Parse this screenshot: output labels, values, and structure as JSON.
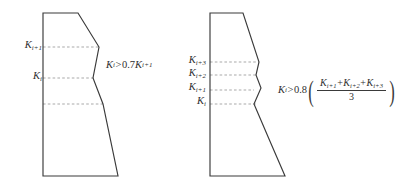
{
  "figure": {
    "background_color": "#ffffff",
    "stroke_color": "#3a3a3a",
    "dash_color": "#9a9a9a",
    "panels": [
      {
        "id": "left-panel",
        "level_labels": [
          {
            "name": "K-i-plus-1",
            "base": "K",
            "sub": "i+1"
          },
          {
            "name": "K-i",
            "base": "K",
            "sub": "i"
          }
        ],
        "formula": {
          "lhs_base": "K",
          "lhs_sub": "i",
          "operator": ">",
          "coefficient": "0.7",
          "rhs_base": "K",
          "rhs_sub": "i+1"
        }
      },
      {
        "id": "right-panel",
        "level_labels": [
          {
            "name": "K-i-plus-3",
            "base": "K",
            "sub": "i+3"
          },
          {
            "name": "K-i-plus-2",
            "base": "K",
            "sub": "i+2"
          },
          {
            "name": "K-i-plus-1",
            "base": "K",
            "sub": "i+1"
          },
          {
            "name": "K-i",
            "base": "K",
            "sub": "i"
          }
        ],
        "formula": {
          "lhs_base": "K",
          "lhs_sub": "i",
          "operator": ">",
          "coefficient": "0.8",
          "open_paren": "(",
          "close_paren": ")",
          "numerator_terms": [
            {
              "base": "K",
              "sub": "i+1"
            },
            {
              "base": "K",
              "sub": "i+2"
            },
            {
              "base": "K",
              "sub": "i+3"
            }
          ],
          "numerator_plus": "+",
          "denominator": "3"
        }
      }
    ]
  }
}
